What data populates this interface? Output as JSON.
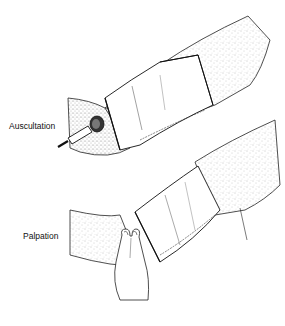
{
  "figure": {
    "panels": [
      {
        "id": "top",
        "label": "Auscultation",
        "instrument": "stethoscope-diaphragm"
      },
      {
        "id": "bottom",
        "label": "Palpation",
        "instrument": "two-finger-palpation"
      }
    ],
    "colors": {
      "ink": "#1a1a1a",
      "stipple": "#8a8a8a",
      "background": "#ffffff"
    }
  }
}
